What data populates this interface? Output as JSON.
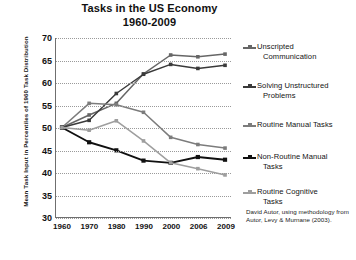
{
  "chart_data": {
    "type": "line",
    "title": "Tasks in the US Economy",
    "subtitle": "1960-2009",
    "xlabel": "",
    "ylabel": "Mean Task Input in Percentiles of 1960 Task Distribution",
    "categories": [
      "1960",
      "1970",
      "1980",
      "1990",
      "2000",
      "2006",
      "2009"
    ],
    "ylim": [
      30,
      70
    ],
    "yticks": [
      30,
      35,
      40,
      45,
      50,
      55,
      60,
      65,
      70
    ],
    "grid": true,
    "legend_position": "right",
    "series": [
      {
        "name": "Unscripted Communication",
        "color": "#666666",
        "values": [
          50.0,
          52.8,
          55.4,
          62.0,
          66.2,
          65.8,
          66.4
        ]
      },
      {
        "name": "Solving Unstructured Problems",
        "color": "#3a3a3a",
        "values": [
          50.0,
          51.6,
          57.6,
          61.9,
          64.1,
          63.2,
          63.9
        ]
      },
      {
        "name": "Routine Manual Tasks",
        "color": "#7c7c7c",
        "values": [
          50.0,
          55.4,
          55.1,
          53.4,
          47.8,
          46.2,
          45.4
        ]
      },
      {
        "name": "Non-Routine Manual Tasks",
        "color": "#101010",
        "values": [
          50.0,
          46.7,
          44.9,
          42.6,
          42.1,
          43.4,
          42.8
        ]
      },
      {
        "name": "Routine Cognitive Tasks",
        "color": "#9e9e9e",
        "values": [
          50.0,
          49.4,
          51.5,
          47.0,
          42.1,
          40.8,
          39.4
        ]
      }
    ],
    "source_note": "David Autor, using methodology from Autor, Levy & Murnane (2003)."
  },
  "legend": {
    "items": [
      {
        "line1": "Unscripted",
        "line2": "Communication"
      },
      {
        "line1": "Solving Unstructured",
        "line2": "Problems"
      },
      {
        "line1": "Routine Manual Tasks",
        "line2": ""
      },
      {
        "line1": "Non-Routine Manual",
        "line2": "Tasks"
      },
      {
        "line1": "Routine Cognitive",
        "line2": "Tasks"
      }
    ]
  }
}
